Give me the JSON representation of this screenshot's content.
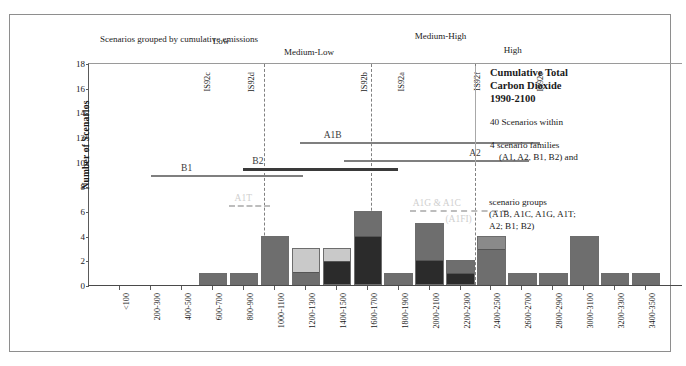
{
  "chart_data": {
    "type": "bar",
    "title": "Cumulative Total Carbon Dioxide 1990-2100",
    "xlabel": "Rance GtC",
    "ylabel": "Number of Scenarios",
    "ylim": [
      0,
      18
    ],
    "yticks": [
      0,
      2,
      4,
      6,
      8,
      10,
      12,
      14,
      16,
      18
    ],
    "grid": false,
    "legend": "right",
    "categories": [
      "<100",
      "200-300",
      "400-500",
      "600-700",
      "800-900",
      "1000-1100",
      "1200-1300",
      "1400-1500",
      "1600-1700",
      "1800-1900",
      "2000-2100",
      "2200-2300",
      "2400-2500",
      "2600-2700",
      "2800-2900",
      "3000-3100",
      "3200-3300",
      "3400-3500"
    ],
    "bin_count": 18,
    "bin_width_gtc": 200,
    "stacked": true,
    "series": [
      {
        "name": "group-dark",
        "color": "#2b2b2b",
        "values": [
          0,
          0,
          0,
          0,
          0,
          0,
          1,
          0,
          4,
          0,
          2,
          0,
          0,
          0,
          0,
          0,
          0,
          0
        ]
      },
      {
        "name": "group-light",
        "color": "#c9c9c9",
        "values": [
          0,
          0,
          0,
          0,
          0,
          0,
          2,
          0,
          0,
          0,
          0,
          0,
          0,
          0,
          0,
          0,
          0,
          0
        ]
      },
      {
        "name": "group-medium",
        "color": "#6e6e6e",
        "values": [
          0,
          0,
          0,
          1,
          1,
          4,
          0,
          3,
          1,
          6,
          3,
          4,
          1,
          1,
          1,
          0,
          4,
          0
        ]
      }
    ],
    "bars": [
      {
        "bin": "<100",
        "index": 0,
        "total": 0,
        "segments": []
      },
      {
        "bin": "200-300",
        "index": 1,
        "total": 0,
        "segments": []
      },
      {
        "bin": "400-500",
        "index": 2,
        "total": 0,
        "segments": []
      },
      {
        "bin": "600-700",
        "index": 3,
        "total": 1,
        "segments": [
          {
            "shade": "medium",
            "value": 1
          }
        ]
      },
      {
        "bin": "800-900",
        "index": 4,
        "total": 1,
        "segments": [
          {
            "shade": "medium",
            "value": 1
          }
        ]
      },
      {
        "bin": "1000-1100",
        "index": 5,
        "total": 4,
        "segments": [
          {
            "shade": "medium",
            "value": 4
          }
        ]
      },
      {
        "bin": "1200-1300",
        "index": 6,
        "total": 3,
        "segments": [
          {
            "shade": "medium",
            "value": 1
          },
          {
            "shade": "light",
            "value": 2
          }
        ]
      },
      {
        "bin": "1400-1500",
        "index": 7,
        "total": 3,
        "segments": [
          {
            "shade": "dark",
            "value": 2
          },
          {
            "shade": "light",
            "value": 1
          }
        ]
      },
      {
        "bin": "1600-1700",
        "index": 8,
        "total": 6,
        "segments": [
          {
            "shade": "dark",
            "value": 4
          },
          {
            "shade": "medium",
            "value": 2
          }
        ]
      },
      {
        "bin": "1800-1900",
        "index": 9,
        "total": 1,
        "segments": [
          {
            "shade": "medium",
            "value": 1
          }
        ]
      },
      {
        "bin": "2000-2100",
        "index": 10,
        "total": 5,
        "segments": [
          {
            "shade": "dark",
            "value": 2
          },
          {
            "shade": "medium",
            "value": 3
          }
        ]
      },
      {
        "bin": "2200-2300",
        "index": 11,
        "total": 2,
        "segments": [
          {
            "shade": "dark",
            "value": 1
          },
          {
            "shade": "medium",
            "value": 1
          }
        ]
      },
      {
        "bin": "2400-2500",
        "index": 12,
        "total": 4,
        "segments": [
          {
            "shade": "medium",
            "value": 3
          },
          {
            "shade": "medium2",
            "value": 1
          }
        ]
      },
      {
        "bin": "2600-2700",
        "index": 13,
        "total": 1,
        "segments": [
          {
            "shade": "medium",
            "value": 1
          }
        ]
      },
      {
        "bin": "2800-2900",
        "index": 14,
        "total": 1,
        "segments": [
          {
            "shade": "medium",
            "value": 1
          }
        ]
      },
      {
        "bin": "3000-3100",
        "index": 15,
        "total": 4,
        "segments": [
          {
            "shade": "medium",
            "value": 4
          }
        ]
      },
      {
        "bin": "3200-3300",
        "index": 16,
        "total": 1,
        "segments": [
          {
            "shade": "medium",
            "value": 1
          }
        ]
      },
      {
        "bin": "3400-3500",
        "index": 17,
        "total": 1,
        "segments": [
          {
            "shade": "medium",
            "value": 1
          }
        ]
      }
    ],
    "colors": {
      "dark": "#2b2b2b",
      "light": "#c9c9c9",
      "medium": "#6e6e6e",
      "medium2": "#8a8a8a",
      "accent": "#7f7f7f"
    },
    "annotations": {
      "grouping_note": "Scenarios grouped by cumulative emissions",
      "group_labels": [
        {
          "label": "Low",
          "x_frac": 0.21
        },
        {
          "label": "Medium-Low",
          "x_frac": 0.33
        },
        {
          "label": "Medium-High",
          "x_frac": 0.55
        },
        {
          "label": "High",
          "x_frac": 0.7
        }
      ],
      "dividers_at_frac": [
        0.295,
        0.475,
        0.65
      ],
      "is92_markers": [
        {
          "label": "IS92c",
          "x_frac": 0.185
        },
        {
          "label": "IS92d",
          "x_frac": 0.26
        },
        {
          "label": "IS92b",
          "x_frac": 0.45
        },
        {
          "label": "IS92a",
          "x_frac": 0.512
        },
        {
          "label": "IS92f",
          "x_frac": 0.64
        },
        {
          "label": "IS92e",
          "x_frac": 0.745
        }
      ],
      "range_bars": [
        {
          "label": "A1B",
          "x0_frac": 0.355,
          "x1_frac": 0.76,
          "y_value": 11.7,
          "label_x_frac": 0.395,
          "color": "#7f7f7f",
          "thick": false
        },
        {
          "label": "A2",
          "x0_frac": 0.43,
          "x1_frac": 0.74,
          "y_value": 10.2,
          "label_x_frac": 0.64,
          "color": "#7f7f7f",
          "thick": false
        },
        {
          "label": "B2",
          "x0_frac": 0.26,
          "x1_frac": 0.52,
          "y_value": 9.6,
          "label_x_frac": 0.275,
          "color": "#3a3a3a",
          "thick": true
        },
        {
          "label": "B1",
          "x0_frac": 0.105,
          "x1_frac": 0.36,
          "y_value": 9.0,
          "label_x_frac": 0.155,
          "color": "#7f7f7f",
          "thick": false
        }
      ],
      "dashed_bars": [
        {
          "label": "A1T",
          "x0_frac": 0.235,
          "x1_frac": 0.305,
          "y_value": 6.6,
          "label_x_frac": 0.245
        },
        {
          "label": "A1G & A1C",
          "x0_frac": 0.54,
          "x1_frac": 0.705,
          "y_value": 6.2,
          "label_x_frac": 0.545
        },
        {
          "label": "(A1FI)",
          "x0_frac": 0.6,
          "x1_frac": 0.6,
          "y_value": 4.9,
          "label_x_frac": 0.6
        }
      ]
    }
  },
  "legend": {
    "title_line1": "Cumulative Total",
    "title_line2": "Carbon Dioxide",
    "title_line3": "1990-2100",
    "count_line": "40 Scenarios within",
    "families_line": "4 scenario families",
    "families_sub": "(A1, A2, B1, B2) and",
    "groups_line": "scenario groups",
    "groups_sub1": "(A1B, A1C, A1G, A1T;",
    "groups_sub2": "A2; B1; B2)"
  }
}
